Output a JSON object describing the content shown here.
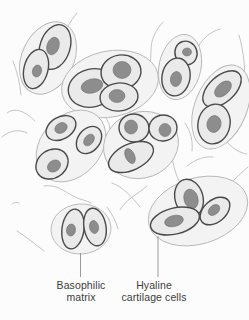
{
  "colors": {
    "background": "#fcfcfc",
    "blob_fill": "#f3f3f3",
    "blob_stroke": "#b6b6b6",
    "cell_fill": "#eaeaea",
    "cell_stroke": "#4a4a4a",
    "nucleus_fill": "#8d8d8d",
    "nucleus_stroke": "#707070",
    "matrix_line": "#bdbdbd",
    "leader_line": "#9a9a9a",
    "label_text": "#3c3c3c"
  },
  "labels": {
    "basophilic_matrix": {
      "line1": "Basophilic",
      "line2": "matrix"
    },
    "hyaline_cells": {
      "line1": "Hyaline",
      "line2": "cartilage cells"
    }
  },
  "figure": {
    "cell_groups": 8,
    "cells_total": 20
  }
}
